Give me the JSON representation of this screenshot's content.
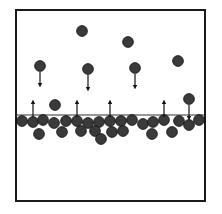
{
  "diagram": {
    "container": {
      "x": 16,
      "y": 10,
      "width": 189,
      "height": 191,
      "stroke": "#1a1a1a",
      "stroke_width": 2
    },
    "surface_line": {
      "x1": 17,
      "x2": 204,
      "y": 115,
      "stroke": "#333333",
      "stroke_width": 1.2
    },
    "particle": {
      "radius": 5.4,
      "fill": "#3a3a3a",
      "stroke": "#111111"
    },
    "liquid_particles": [
      [
        22,
        121
      ],
      [
        33,
        122
      ],
      [
        43,
        120
      ],
      [
        54,
        123
      ],
      [
        66,
        121
      ],
      [
        77,
        121
      ],
      [
        88,
        123
      ],
      [
        99,
        122
      ],
      [
        110,
        121
      ],
      [
        121,
        121
      ],
      [
        132,
        120
      ],
      [
        143,
        124
      ],
      [
        153,
        122
      ],
      [
        164,
        120
      ],
      [
        179,
        121
      ],
      [
        189,
        125
      ],
      [
        199,
        120
      ],
      [
        39,
        134
      ],
      [
        62,
        132
      ],
      [
        81,
        131
      ],
      [
        95,
        131
      ],
      [
        101,
        139
      ],
      [
        112,
        132
      ],
      [
        123,
        131
      ],
      [
        152,
        134
      ],
      [
        172,
        132
      ]
    ],
    "vapor_particles": [
      [
        82,
        31
      ],
      [
        128,
        42
      ],
      [
        178,
        61
      ],
      [
        40,
        66
      ],
      [
        88,
        69
      ],
      [
        135,
        68
      ],
      [
        55,
        105
      ],
      [
        189,
        99
      ]
    ],
    "evaporation_arrows": [
      {
        "x": 33,
        "y_from": 117,
        "y_to": 102
      },
      {
        "x": 77,
        "y_from": 117,
        "y_to": 102
      },
      {
        "x": 110,
        "y_from": 117,
        "y_to": 102
      },
      {
        "x": 164,
        "y_from": 117,
        "y_to": 102
      }
    ],
    "condensation_arrows": [
      {
        "x": 40,
        "y_from": 72,
        "y_to": 85
      },
      {
        "x": 88,
        "y_from": 75,
        "y_to": 89
      },
      {
        "x": 135,
        "y_from": 74,
        "y_to": 87
      },
      {
        "x": 189,
        "y_from": 105,
        "y_to": 118
      }
    ]
  }
}
